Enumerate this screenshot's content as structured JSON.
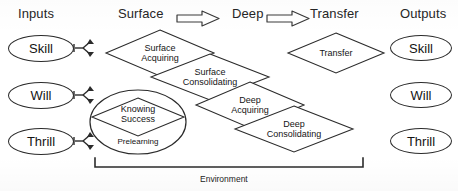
{
  "diagram": {
    "column_headers": [
      {
        "id": "inputs",
        "label": "Inputs"
      },
      {
        "id": "surface",
        "label": "Surface"
      },
      {
        "id": "deep",
        "label": "Deep"
      },
      {
        "id": "transfer",
        "label": "Transfer"
      },
      {
        "id": "outputs",
        "label": "Outputs"
      }
    ],
    "phase_arrows": [
      {
        "id": "arrow-surface-to-deep",
        "from": "Surface",
        "to": "Deep"
      },
      {
        "id": "arrow-deep-to-transfer",
        "from": "Deep",
        "to": "Transfer"
      }
    ],
    "inputs": [
      {
        "id": "input-skill",
        "label": "Skill"
      },
      {
        "id": "input-will",
        "label": "Will"
      },
      {
        "id": "input-thrill",
        "label": "Thrill"
      }
    ],
    "outputs": [
      {
        "id": "output-skill",
        "label": "Skill"
      },
      {
        "id": "output-will",
        "label": "Will"
      },
      {
        "id": "output-thrill",
        "label": "Thrill"
      }
    ],
    "prelearning": {
      "circle_label": "Prelearning",
      "diamond_line1": "Knowing",
      "diamond_line2": "Success"
    },
    "phases": [
      {
        "id": "surface-acquiring",
        "line1": "Surface",
        "line2": "Acquiring"
      },
      {
        "id": "surface-consolidating",
        "line1": "Surface",
        "line2": "Consolidating"
      },
      {
        "id": "deep-acquiring",
        "line1": "Deep",
        "line2": "Acquiring"
      },
      {
        "id": "deep-consolidating",
        "line1": "Deep",
        "line2": "Consolidating"
      },
      {
        "id": "transfer",
        "line1": "Transfer",
        "line2": ""
      }
    ],
    "environment": {
      "label": "Environment"
    },
    "colors": {
      "stroke": "#2b2b2b",
      "text": "#141414",
      "background": "#ffffff"
    }
  }
}
